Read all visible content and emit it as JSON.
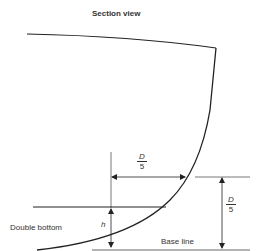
{
  "title": "Section view",
  "labels": {
    "double_bottom": "Double bottom",
    "base_line": "Base line",
    "h": "h"
  },
  "dimensions": {
    "horizontal_offset": {
      "numerator": "D",
      "denominator": "5"
    },
    "vertical_height": {
      "numerator": "D",
      "denominator": "5"
    }
  },
  "colors": {
    "line": "#222222",
    "text": "#333333",
    "thin_line": "#555555"
  }
}
